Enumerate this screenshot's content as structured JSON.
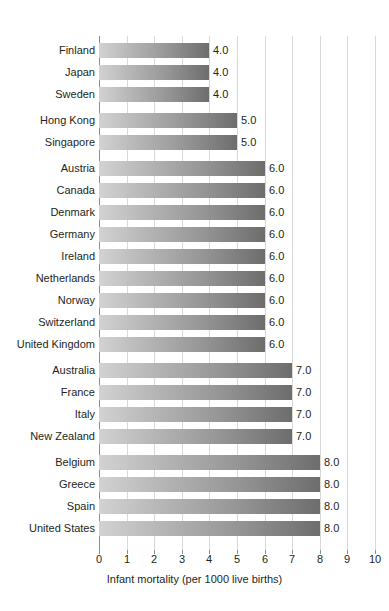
{
  "chart_data": {
    "type": "bar",
    "orientation": "horizontal",
    "title": "",
    "subtitle": "",
    "xlabel": "Infant mortality (per 1000 live births)",
    "ylabel": "",
    "xlim": [
      0,
      10
    ],
    "xticks": [
      "0",
      "1",
      "2",
      "3",
      "4",
      "5",
      "6",
      "7",
      "8",
      "9",
      "10"
    ],
    "grid": true,
    "legend": null,
    "value_label_format": "one-decimal",
    "categories": [
      "Finland",
      "Japan",
      "Sweden",
      "Hong Kong",
      "Singapore",
      "Austria",
      "Canada",
      "Denmark",
      "Germany",
      "Ireland",
      "Netherlands",
      "Norway",
      "Switzerland",
      "United Kingdom",
      "Australia",
      "France",
      "Italy",
      "New Zealand",
      "Belgium",
      "Greece",
      "Spain",
      "United States"
    ],
    "values": [
      4.0,
      4.0,
      4.0,
      5.0,
      5.0,
      6.0,
      6.0,
      6.0,
      6.0,
      6.0,
      6.0,
      6.0,
      6.0,
      6.0,
      7.0,
      7.0,
      7.0,
      7.0,
      8.0,
      8.0,
      8.0,
      8.0
    ],
    "value_labels": [
      "4.0",
      "4.0",
      "4.0",
      "5.0",
      "5.0",
      "6.0",
      "6.0",
      "6.0",
      "6.0",
      "6.0",
      "6.0",
      "6.0",
      "6.0",
      "6.0",
      "7.0",
      "7.0",
      "7.0",
      "7.0",
      "8.0",
      "8.0",
      "8.0",
      "8.0"
    ],
    "group_breaks_after": [
      2,
      4,
      13,
      17
    ],
    "colors": {
      "bar_gradient_start": "#d2d2d2",
      "bar_gradient_end": "#6d6d6d",
      "gridline": "#d8d8d8",
      "axis": "#8d8d8d",
      "text": "#231f20",
      "background": "#ffffff"
    }
  }
}
